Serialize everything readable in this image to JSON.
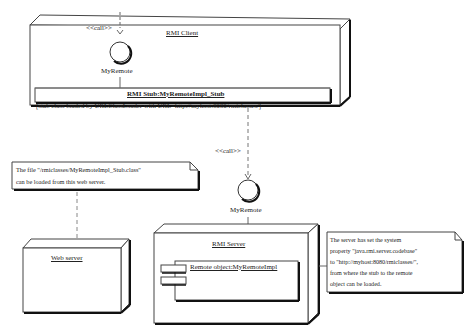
{
  "diagram": {
    "type": "UML deployment diagram",
    "nodes": [
      {
        "id": "rmi-client",
        "label": "RMI Client"
      },
      {
        "id": "web-server",
        "label": "Web server"
      },
      {
        "id": "rmi-server",
        "label": "RMI Server"
      }
    ],
    "components": [
      {
        "id": "stub",
        "title": "RMI Stub:MyRemoteImpl_Stub",
        "note": "[stub class loaded by URLClassLoader with URL=http://myhost:8080/rmiclasses/]"
      },
      {
        "id": "remote-object",
        "title": "Remote object:MyRemoteImpl"
      }
    ],
    "interfaces": [
      {
        "id": "client-interface",
        "label": "MyRemote"
      },
      {
        "id": "server-interface",
        "label": "MyRemote"
      }
    ],
    "dependencies": [
      {
        "label": "<<call>>"
      },
      {
        "label": "<<call>>"
      }
    ],
    "notes": [
      {
        "id": "web-note",
        "lines": [
          "The file \"/rmiclasses/MyRemoteImpl_Stub.class\"",
          "can be loaded from this web server."
        ]
      },
      {
        "id": "server-note",
        "lines": [
          "The server has set the system",
          "property \"java.rmi.server.codebase\"",
          "to \"http://myhost:8080/rmiclasses/\",",
          "from where the stub to the remote",
          "object can be loaded."
        ]
      }
    ]
  }
}
